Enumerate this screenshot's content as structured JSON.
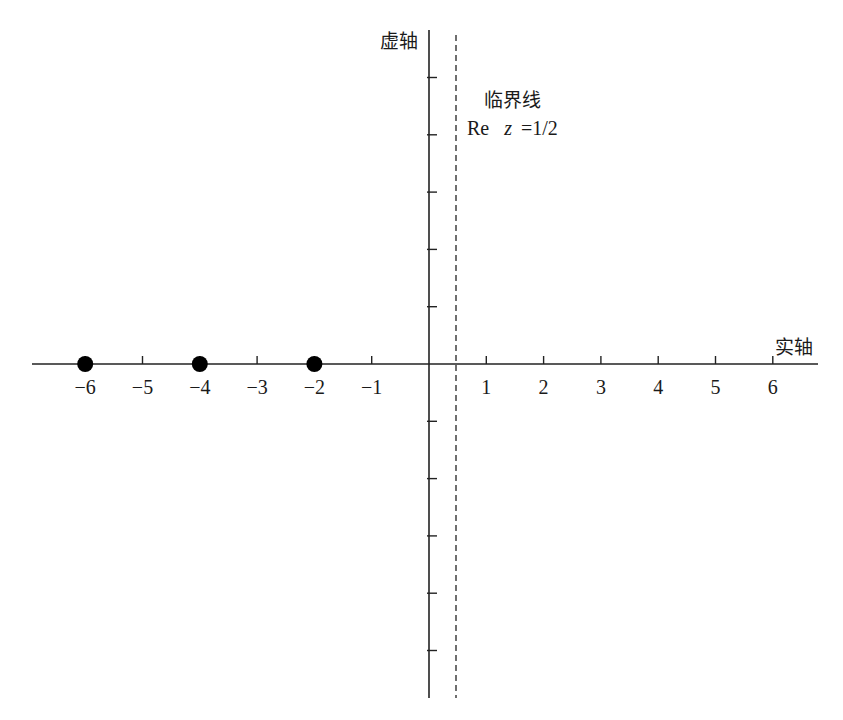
{
  "chart_data": {
    "type": "scatter",
    "title": "",
    "xlabel": "实轴",
    "ylabel": "虚轴",
    "xlim": [
      -6.8,
      6.8
    ],
    "ylim": [
      -5.8,
      5.8
    ],
    "x_ticks": [
      -6,
      -5,
      -4,
      -3,
      -2,
      -1,
      1,
      2,
      3,
      4,
      5,
      6
    ],
    "x_tick_labels": [
      "−6",
      "−5",
      "−4",
      "−3",
      "−2",
      "−1",
      "1",
      "2",
      "3",
      "4",
      "5",
      "6"
    ],
    "y_ticks": [
      -5,
      -4,
      -3,
      -2,
      -1,
      1,
      2,
      3,
      4,
      5
    ],
    "y_tick_labels": [],
    "grid": false,
    "series": [
      {
        "name": "trivial zeros",
        "points": [
          {
            "x": -6,
            "y": 0
          },
          {
            "x": -4,
            "y": 0
          },
          {
            "x": -2,
            "y": 0
          }
        ],
        "marker": "filled-circle",
        "color": "#000000"
      }
    ],
    "reference_lines": [
      {
        "orientation": "vertical",
        "x": 0.5,
        "style": "dashed",
        "label_line1": "临界线",
        "label_line2": "Re  z =1/2"
      }
    ],
    "annotations": [
      "临界线",
      "Re z =1/2"
    ]
  },
  "labels": {
    "x_axis": "实轴",
    "y_axis": "虚轴",
    "critical_line_title": "临界线",
    "critical_line_eq_re": "Re",
    "critical_line_eq_z": "z",
    "critical_line_eq_val": "=1/2"
  },
  "colors": {
    "axis": "#222222",
    "dot": "#000000",
    "background": "#ffffff"
  }
}
